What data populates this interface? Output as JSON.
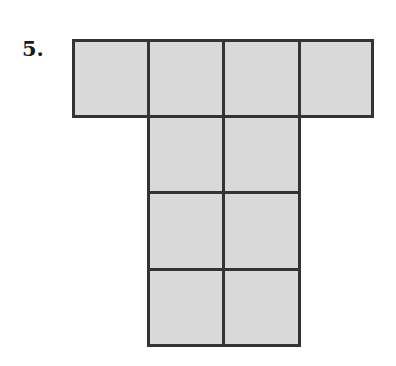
{
  "problem": {
    "number": "5."
  },
  "figure": {
    "fill_color": "#d9d9d9",
    "stroke_color": "#333333",
    "cells": [
      {
        "x": 72,
        "y": 39,
        "w": 78,
        "h": 79
      },
      {
        "x": 147,
        "y": 39,
        "w": 78,
        "h": 79
      },
      {
        "x": 222,
        "y": 39,
        "w": 79,
        "h": 79
      },
      {
        "x": 298,
        "y": 39,
        "w": 76,
        "h": 79
      },
      {
        "x": 147,
        "y": 115,
        "w": 78,
        "h": 79
      },
      {
        "x": 222,
        "y": 115,
        "w": 79,
        "h": 79
      },
      {
        "x": 147,
        "y": 191,
        "w": 78,
        "h": 80
      },
      {
        "x": 222,
        "y": 191,
        "w": 79,
        "h": 80
      },
      {
        "x": 147,
        "y": 268,
        "w": 78,
        "h": 79
      },
      {
        "x": 222,
        "y": 268,
        "w": 79,
        "h": 79
      }
    ]
  }
}
